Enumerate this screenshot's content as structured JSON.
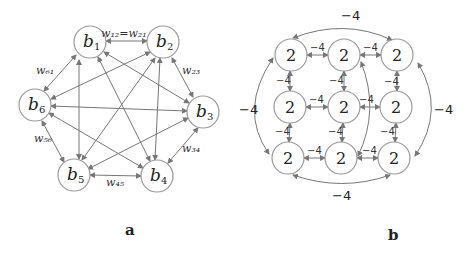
{
  "panel_a": {
    "caption": "a",
    "nodes": [
      {
        "id": "b1",
        "label": "b",
        "sub": "1",
        "x": 90,
        "y": 42
      },
      {
        "id": "b2",
        "label": "b",
        "sub": "2",
        "x": 163,
        "y": 42
      },
      {
        "id": "b3",
        "label": "b",
        "sub": "3",
        "x": 203,
        "y": 112
      },
      {
        "id": "b4",
        "label": "b",
        "sub": "4",
        "x": 157,
        "y": 176
      },
      {
        "id": "b5",
        "label": "b",
        "sub": "5",
        "x": 74,
        "y": 175
      },
      {
        "id": "b6",
        "label": "b",
        "sub": "6",
        "x": 35,
        "y": 105
      }
    ],
    "weight_labels": {
      "w12": "w₁₂=w₂₁",
      "w23": "w₂₃",
      "w34": "w₃₄",
      "w45": "w₄₅",
      "w56": "w₅₆",
      "w61": "w₆₁"
    }
  },
  "panel_b": {
    "caption": "b",
    "node_value": "2",
    "edge_value": "−4",
    "rows": [
      [
        "2",
        "2",
        "2"
      ],
      [
        "2",
        "2",
        "2"
      ],
      [
        "2",
        "2",
        "2"
      ]
    ]
  }
}
